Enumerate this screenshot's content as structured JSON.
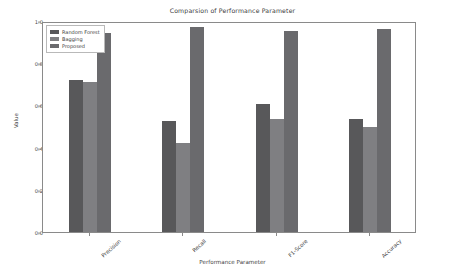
{
  "chart_data": {
    "type": "bar",
    "title": "Comparsion of Performance Parameter",
    "xlabel": "Performance Parameter",
    "ylabel": "Value",
    "categories": [
      "Precision",
      "Recall",
      "F1-Score",
      "Accuracy"
    ],
    "series": [
      {
        "name": "Random Forest",
        "color": "#58585a",
        "values": [
          0.72,
          0.525,
          0.605,
          0.535
        ]
      },
      {
        "name": "Bagging",
        "color": "#7f7f82",
        "values": [
          0.71,
          0.42,
          0.535,
          0.5
        ]
      },
      {
        "name": "Proposed",
        "color": "#6a6a6d",
        "values": [
          0.945,
          0.97,
          0.955,
          0.96
        ]
      }
    ],
    "ylim": [
      0.0,
      1.0
    ],
    "ytick_labels": [
      "0.0",
      "0.2",
      "0.4",
      "0.6",
      "0.8",
      "1.0"
    ],
    "ytick_values": [
      0.0,
      0.2,
      0.4,
      0.6,
      0.8,
      1.0
    ],
    "grid": false,
    "legend_position": "upper left"
  }
}
